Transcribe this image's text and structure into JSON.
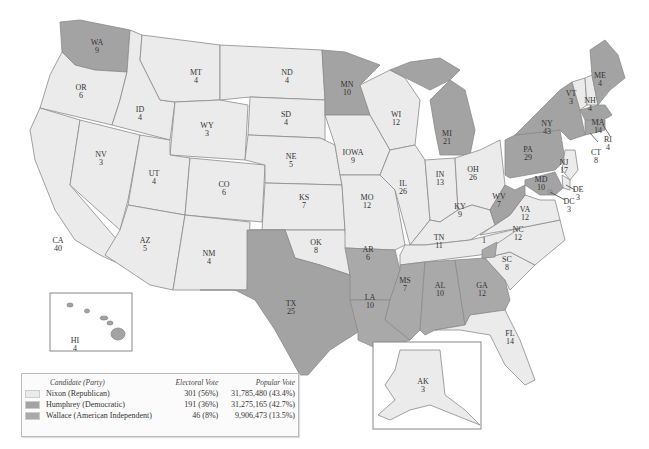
{
  "colors": {
    "nixon": "#ebebeb",
    "humphrey": "#a3a3a3",
    "wallace": "#a9a9a9"
  },
  "states": {
    "WA": {
      "abbr": "WA",
      "ev": "9",
      "party": "humphrey"
    },
    "OR": {
      "abbr": "OR",
      "ev": "6",
      "party": "nixon"
    },
    "CA": {
      "abbr": "CA",
      "ev": "40",
      "party": "nixon"
    },
    "ID": {
      "abbr": "ID",
      "ev": "4",
      "party": "nixon"
    },
    "NV": {
      "abbr": "NV",
      "ev": "3",
      "party": "nixon"
    },
    "MT": {
      "abbr": "MT",
      "ev": "4",
      "party": "nixon"
    },
    "WY": {
      "abbr": "WY",
      "ev": "3",
      "party": "nixon"
    },
    "UT": {
      "abbr": "UT",
      "ev": "4",
      "party": "nixon"
    },
    "AZ": {
      "abbr": "AZ",
      "ev": "5",
      "party": "nixon"
    },
    "CO": {
      "abbr": "CO",
      "ev": "6",
      "party": "nixon"
    },
    "NM": {
      "abbr": "NM",
      "ev": "4",
      "party": "nixon"
    },
    "ND": {
      "abbr": "ND",
      "ev": "4",
      "party": "nixon"
    },
    "SD": {
      "abbr": "SD",
      "ev": "4",
      "party": "nixon"
    },
    "NE": {
      "abbr": "NE",
      "ev": "5",
      "party": "nixon"
    },
    "KS": {
      "abbr": "KS",
      "ev": "7",
      "party": "nixon"
    },
    "OK": {
      "abbr": "OK",
      "ev": "8",
      "party": "nixon"
    },
    "TX": {
      "abbr": "TX",
      "ev": "25",
      "party": "humphrey"
    },
    "MN": {
      "abbr": "MN",
      "ev": "10",
      "party": "humphrey"
    },
    "IA": {
      "abbr": "IOWA",
      "ev": "9",
      "party": "nixon"
    },
    "MO": {
      "abbr": "MO",
      "ev": "12",
      "party": "nixon"
    },
    "AR": {
      "abbr": "AR",
      "ev": "6",
      "party": "wallace"
    },
    "LA": {
      "abbr": "LA",
      "ev": "10",
      "party": "wallace"
    },
    "WI": {
      "abbr": "WI",
      "ev": "12",
      "party": "nixon"
    },
    "IL": {
      "abbr": "IL",
      "ev": "26",
      "party": "nixon"
    },
    "MI": {
      "abbr": "MI",
      "ev": "21",
      "party": "humphrey"
    },
    "IN": {
      "abbr": "IN",
      "ev": "13",
      "party": "nixon"
    },
    "OH": {
      "abbr": "OH",
      "ev": "26",
      "party": "nixon"
    },
    "KY": {
      "abbr": "KY",
      "ev": "9",
      "party": "nixon"
    },
    "TN": {
      "abbr": "TN",
      "ev": "11",
      "party": "nixon"
    },
    "MS": {
      "abbr": "MS",
      "ev": "7",
      "party": "wallace"
    },
    "AL": {
      "abbr": "AL",
      "ev": "10",
      "party": "wallace"
    },
    "GA": {
      "abbr": "GA",
      "ev": "12",
      "party": "wallace"
    },
    "FL": {
      "abbr": "FL",
      "ev": "14",
      "party": "nixon"
    },
    "SC": {
      "abbr": "SC",
      "ev": "8",
      "party": "nixon"
    },
    "NC": {
      "abbr": "NC",
      "ev": "12",
      "party": "nixon"
    },
    "NC_wallace": {
      "abbr": "",
      "ev": "1",
      "party": "wallace"
    },
    "VA": {
      "abbr": "VA",
      "ev": "12",
      "party": "nixon"
    },
    "WV": {
      "abbr": "WV",
      "ev": "7",
      "party": "humphrey"
    },
    "PA": {
      "abbr": "PA",
      "ev": "29",
      "party": "humphrey"
    },
    "NY": {
      "abbr": "NY",
      "ev": "43",
      "party": "humphrey"
    },
    "VT": {
      "abbr": "VT",
      "ev": "3",
      "party": "nixon"
    },
    "NH": {
      "abbr": "NH",
      "ev": "4",
      "party": "nixon"
    },
    "ME": {
      "abbr": "ME",
      "ev": "4",
      "party": "humphrey"
    },
    "MA": {
      "abbr": "MA",
      "ev": "14",
      "party": "humphrey"
    },
    "RI": {
      "abbr": "RI",
      "ev": "4",
      "party": "humphrey"
    },
    "CT": {
      "abbr": "CT",
      "ev": "8",
      "party": "humphrey"
    },
    "NJ": {
      "abbr": "NJ",
      "ev": "17",
      "party": "nixon"
    },
    "DE": {
      "abbr": "DE",
      "ev": "3",
      "party": "nixon"
    },
    "MD": {
      "abbr": "MD",
      "ev": "10",
      "party": "humphrey"
    },
    "DC": {
      "abbr": "DC",
      "ev": "3",
      "party": "humphrey"
    },
    "HI": {
      "abbr": "HI",
      "ev": "4",
      "party": "humphrey"
    },
    "AK": {
      "abbr": "AK",
      "ev": "3",
      "party": "nixon"
    }
  },
  "legend": {
    "headers": {
      "candidate": "Candidate (Party)",
      "electoral": "Electoral Vote",
      "popular": "Popular Vote"
    },
    "rows": [
      {
        "party": "nixon",
        "candidate": "Nixon (Republican)",
        "electoral": "301 (56%)",
        "popular": "31,785,480 (43.4%)"
      },
      {
        "party": "humphrey",
        "candidate": "Humphrey (Democratic)",
        "electoral": "191 (36%)",
        "popular": "31,275,165 (42.7%)"
      },
      {
        "party": "wallace",
        "candidate": "Wallace (American Independent)",
        "electoral": "46 (8%)",
        "popular": "9,906,473 (13.5%)"
      }
    ]
  }
}
